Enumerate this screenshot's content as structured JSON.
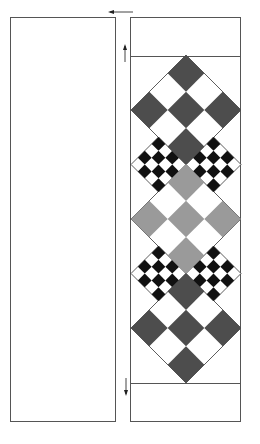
{
  "figure": {
    "left_panel": {
      "label": ""
    },
    "right_panel": {
      "header_band": "",
      "footer_band": "",
      "pattern": [
        {
          "kind": "checker-diamond",
          "size": 3,
          "color": "#4d4d4d",
          "position": "top"
        },
        {
          "kind": "checker-diamond",
          "size": 4,
          "color": "#111111",
          "position": "upper-left"
        },
        {
          "kind": "checker-diamond",
          "size": 4,
          "color": "#111111",
          "position": "upper-right"
        },
        {
          "kind": "checker-diamond",
          "size": 3,
          "color": "#9a9a9a",
          "position": "middle"
        },
        {
          "kind": "checker-diamond",
          "size": 4,
          "color": "#111111",
          "position": "lower-left"
        },
        {
          "kind": "checker-diamond",
          "size": 4,
          "color": "#111111",
          "position": "lower-right"
        },
        {
          "kind": "checker-diamond",
          "size": 3,
          "color": "#4d4d4d",
          "position": "bottom"
        }
      ]
    },
    "arrows": [
      {
        "name": "top-arrow",
        "direction": "left"
      },
      {
        "name": "upper-arrow",
        "direction": "up"
      },
      {
        "name": "lower-arrow",
        "direction": "down"
      }
    ],
    "colors": {
      "dark": "#4d4d4d",
      "light": "#9a9a9a",
      "black": "#111111",
      "border": "#555555"
    }
  }
}
